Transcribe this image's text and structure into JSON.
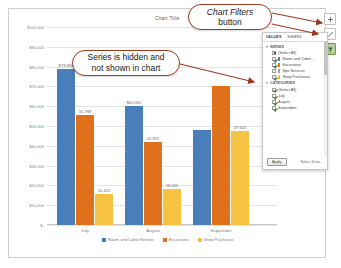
{
  "chart": {
    "title": "Chart Title",
    "y_axis_ticks": [
      "$100,000",
      "$90,000",
      "$80,000",
      "$70,000",
      "$60,000",
      "$50,000",
      "$40,000",
      "$30,000",
      "$20,000",
      "$10,000",
      "$-"
    ],
    "legend": [
      {
        "label": "Room and Cabin Rentals",
        "color": "#4a7ebb"
      },
      {
        "label": "Excursions",
        "color": "#e0701a"
      },
      {
        "label": "Shop Purchases",
        "color": "#f5c242"
      }
    ]
  },
  "chart_data": {
    "type": "bar",
    "title": "Chart Title",
    "xlabel": "",
    "ylabel": "",
    "ylim": [
      0,
      100000
    ],
    "grid": true,
    "legend_position": "bottom",
    "categories": [
      "July",
      "August",
      "September"
    ],
    "series": [
      {
        "name": "Room and Cabin Rentals",
        "color": "#4a7ebb",
        "values": [
          78980,
          60055,
          48100
        ],
        "labels": [
          "$78,980",
          "$60,055",
          ""
        ]
      },
      {
        "name": "Excursions",
        "color": "#e0701a",
        "values": [
          55788,
          41855,
          70200
        ],
        "labels": [
          "55,788",
          "41,855",
          ""
        ]
      },
      {
        "name": "Shop Purchases",
        "color": "#f5c242",
        "values": [
          15455,
          18055,
          47655
        ],
        "labels": [
          "15,455",
          "18,055",
          "47,655"
        ]
      }
    ],
    "hidden_series": [
      "Spa Services"
    ]
  },
  "side_buttons": [
    {
      "name": "chart-elements",
      "glyph": "+"
    },
    {
      "name": "chart-styles",
      "glyph": "✎"
    },
    {
      "name": "chart-filters",
      "glyph": "▼"
    }
  ],
  "filter_pane": {
    "tabs": [
      {
        "label": "VALUES",
        "selected": true
      },
      {
        "label": "NAMES",
        "selected": false
      }
    ],
    "sections": [
      {
        "title": "SERIES",
        "rows": [
          {
            "label": "(Select All)",
            "checked": true,
            "all": true,
            "swatch": ""
          },
          {
            "label": "Room and Cabin...",
            "checked": true,
            "all": false,
            "swatch": "#4a7ebb"
          },
          {
            "label": "Excursions",
            "checked": true,
            "all": false,
            "swatch": "#e0701a"
          },
          {
            "label": "Spa Services",
            "checked": false,
            "all": false,
            "swatch": "#a0a0a0"
          },
          {
            "label": "Shop Purchases",
            "checked": true,
            "all": false,
            "swatch": "#f5c242"
          }
        ]
      },
      {
        "title": "CATEGORIES",
        "rows": [
          {
            "label": "(Select All)",
            "checked": true,
            "all": false,
            "swatch": ""
          },
          {
            "label": "July",
            "checked": true,
            "all": false,
            "swatch": ""
          },
          {
            "label": "August",
            "checked": true,
            "all": false,
            "swatch": ""
          },
          {
            "label": "September",
            "checked": true,
            "all": false,
            "swatch": ""
          }
        ]
      }
    ],
    "apply_label": "Apply",
    "select_data_label": "Select Data..."
  },
  "callouts": {
    "filters": {
      "line1": "Chart Filters",
      "line2": "button"
    },
    "hidden": {
      "line1": "Series is hidden and",
      "line2": "not shown in chart"
    }
  }
}
